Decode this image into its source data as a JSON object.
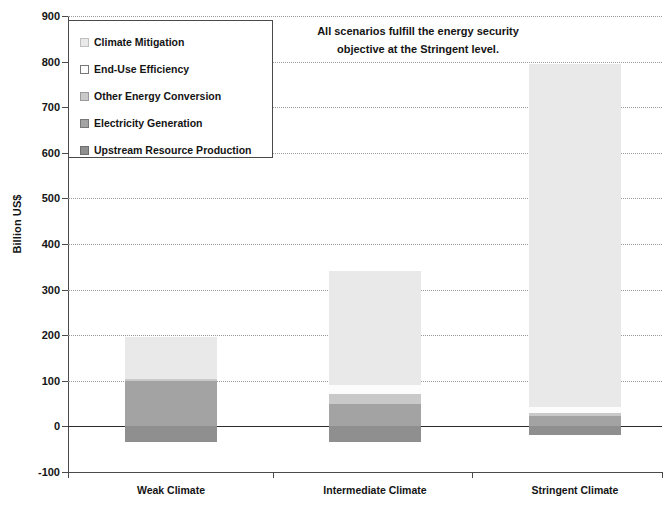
{
  "chart_data": {
    "type": "bar",
    "subtype": "stacked-bar",
    "title": "",
    "xlabel": "",
    "ylabel": "Billion US$",
    "ylim": [
      -100,
      900
    ],
    "ytick_step": 100,
    "yticks": [
      900,
      800,
      700,
      600,
      500,
      400,
      300,
      200,
      100,
      0,
      -100
    ],
    "ytick_labels": [
      "900",
      "800",
      "700",
      "600",
      "500",
      "400",
      "300",
      "200",
      "100",
      "0",
      "-100"
    ],
    "grid": true,
    "grid_style": "dotted-horizontal",
    "legend_position": "top-left-inside",
    "categories": [
      "Weak Climate",
      "Intermediate Climate",
      "Stringent Climate"
    ],
    "series": [
      {
        "name": "Climate Mitigation",
        "color": "#e9e9e9",
        "values": [
          92,
          250,
          753
        ]
      },
      {
        "name": "End-Use Efficiency",
        "color": "#fcfcfc",
        "values": [
          0,
          18,
          12
        ]
      },
      {
        "name": "Other Energy Conversion",
        "color": "#c9c9c9",
        "values": [
          3,
          22,
          8
        ]
      },
      {
        "name": "Electricity Generation",
        "color": "#a3a3a3",
        "values": [
          100,
          50,
          22
        ]
      },
      {
        "name": "Upstream Resource Production",
        "color": "#8f8f8f",
        "values": [
          -35,
          -35,
          -18
        ]
      }
    ],
    "stack_totals_positive": [
      195,
      340,
      795
    ],
    "stack_totals_negative": [
      -35,
      -35,
      -18
    ],
    "annotations": [
      {
        "name": "energy-security-note",
        "line1": "All scenarios fulfill the energy security",
        "line2": "objective at the Stringent level."
      }
    ]
  },
  "legend": {
    "items": [
      {
        "label": "Climate Mitigation",
        "color": "#e9e9e9",
        "border": "#bfbfbf"
      },
      {
        "label": "End-Use Efficiency",
        "color": "#fdfdfd",
        "border": "#777777"
      },
      {
        "label": "Other Energy Conversion",
        "color": "#c9c9c9",
        "border": "#9a9a9a"
      },
      {
        "label": "Electricity Generation",
        "color": "#a3a3a3",
        "border": "#777777"
      },
      {
        "label": "Upstream Resource Production",
        "color": "#8f8f8f",
        "border": "#6e6e6e"
      }
    ]
  },
  "axis": {
    "y_title": "Billion US$"
  }
}
